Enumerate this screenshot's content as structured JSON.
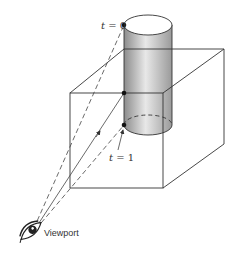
{
  "diagram": {
    "labels": {
      "t0_var": "t",
      "t0_eq": " = 0",
      "t1_var": "t",
      "t1_eq": " = 1",
      "viewport": "Viewport"
    },
    "colors": {
      "stroke": "#333333",
      "cylinder_dark": "#8a8a8a",
      "cylinder_light": "#e6e6e6",
      "background": "#ffffff"
    },
    "elements": [
      "eye-viewpoint",
      "cube-wireframe",
      "cylinder-shaded",
      "ray-solid-to-surface-point",
      "ray-dashed-to-t0",
      "ray-dashed-to-t1",
      "point-t0",
      "point-surface",
      "point-t1"
    ]
  }
}
